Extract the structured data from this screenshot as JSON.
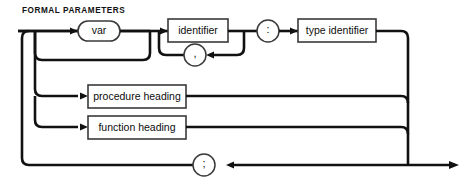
{
  "diagram": {
    "title": "FORMAL PARAMETERS",
    "type": "railroad-syntax-diagram",
    "notation": "Pascal syntax (railroad) diagram",
    "nodes": {
      "var_keyword": "var",
      "identifier": "identifier",
      "comma": ",",
      "colon": ":",
      "type_identifier": "type identifier",
      "procedure_heading": "procedure heading",
      "function_heading": "function heading",
      "semicolon": ";"
    },
    "branches": [
      "var identifier , : type identifier",
      "procedure heading",
      "function heading"
    ],
    "colors": {
      "rail": "#111111",
      "node_border": "#3a3a3a",
      "node_fill": "#ffffff",
      "text": "#0d0d0d",
      "background": "#ffffff"
    }
  }
}
